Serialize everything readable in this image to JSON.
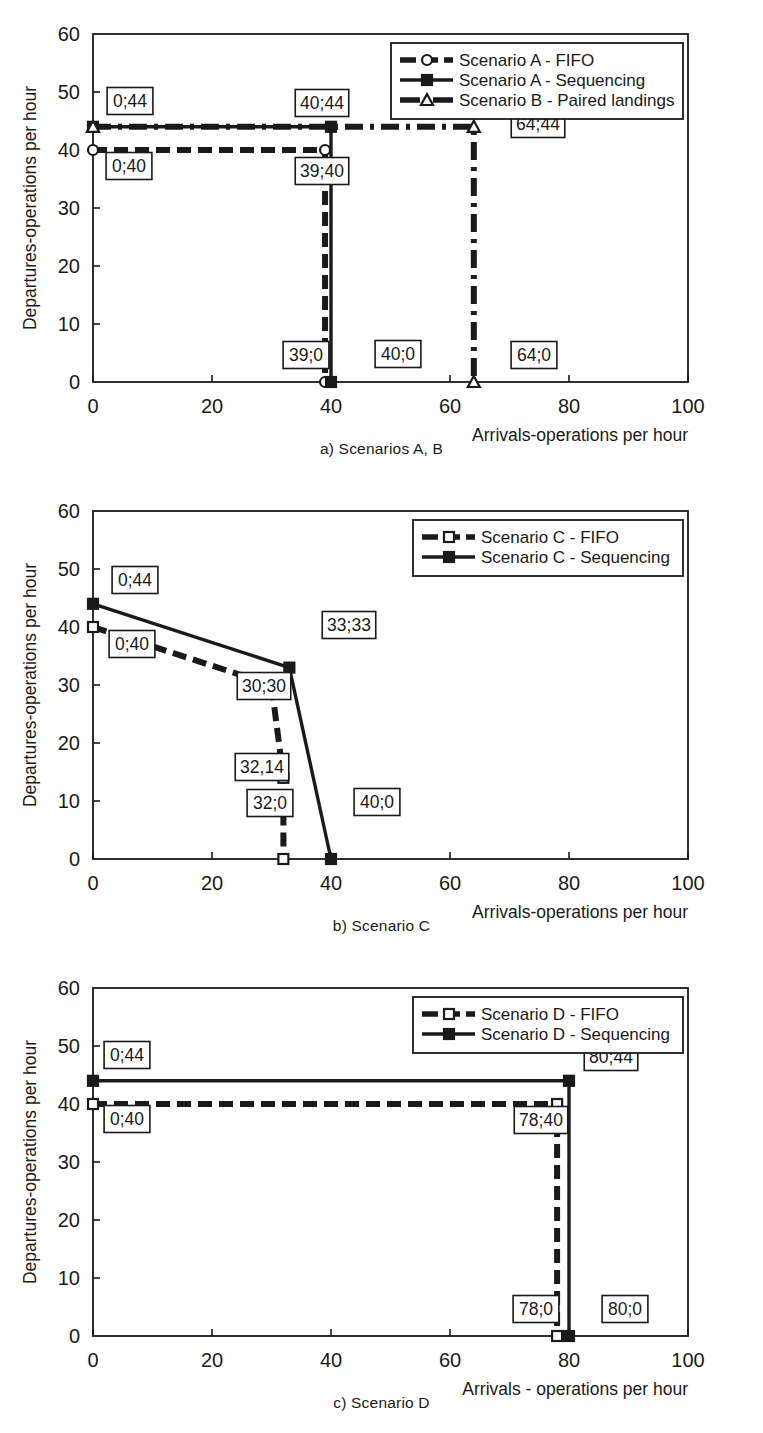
{
  "figure": {
    "panels": [
      {
        "id": "panel-a",
        "caption": "a) Scenarios A, B",
        "xlabel": "Arrivals-operations per hour",
        "ylabel": "Departures-operations per hour",
        "xticks": [
          "0",
          "20",
          "40",
          "60",
          "80",
          "100"
        ],
        "yticks": [
          "0",
          "10",
          "20",
          "30",
          "40",
          "50",
          "60"
        ],
        "legend": [
          {
            "label": "Scenario A - FIFO",
            "marker": "circle-open",
            "line": "dashed"
          },
          {
            "label": "Scenario A - Sequencing",
            "marker": "square-filled",
            "line": "solid"
          },
          {
            "label": "Scenario B - Paired landings",
            "marker": "triangle-open",
            "line": "dash-dot"
          }
        ],
        "annotations": [
          "0;44",
          "0;40",
          "40;44",
          "39;40",
          "39;0",
          "40;0",
          "64;44",
          "64;0"
        ]
      },
      {
        "id": "panel-b",
        "caption": "b)  Scenario C",
        "xlabel": "Arrivals-operations per hour",
        "ylabel": "Departures-operations per hour",
        "xticks": [
          "0",
          "20",
          "40",
          "60",
          "80",
          "100"
        ],
        "yticks": [
          "0",
          "10",
          "20",
          "30",
          "40",
          "50",
          "60"
        ],
        "legend": [
          {
            "label": "Scenario C - FIFO",
            "marker": "square-open",
            "line": "dashed"
          },
          {
            "label": "Scenario C - Sequencing",
            "marker": "square-filled",
            "line": "solid"
          }
        ],
        "annotations": [
          "0;44",
          "0;40",
          "33;33",
          "30;30",
          "32,14",
          "32;0",
          "40;0"
        ]
      },
      {
        "id": "panel-c",
        "caption": "c) Scenario D",
        "xlabel": "Arrivals - operations per hour",
        "ylabel": "Departures-operations per hour",
        "xticks": [
          "0",
          "20",
          "40",
          "60",
          "80",
          "100"
        ],
        "yticks": [
          "0",
          "10",
          "20",
          "30",
          "40",
          "50",
          "60"
        ],
        "legend": [
          {
            "label": "Scenario D - FIFO",
            "marker": "square-open",
            "line": "dashed"
          },
          {
            "label": "Scenario D - Sequencing",
            "marker": "square-filled",
            "line": "solid"
          }
        ],
        "annotations": [
          "0;44",
          "0;40",
          "80;44",
          "78;40",
          "78;0",
          "80;0"
        ]
      }
    ]
  },
  "chart_data": [
    {
      "type": "line",
      "title": "a) Scenarios A, B",
      "xlabel": "Arrivals-operations per hour",
      "ylabel": "Departures-operations per hour",
      "xlim": [
        0,
        100
      ],
      "ylim": [
        0,
        60
      ],
      "xticks": [
        0,
        20,
        40,
        60,
        80,
        100
      ],
      "yticks": [
        0,
        10,
        20,
        30,
        40,
        50,
        60
      ],
      "grid": false,
      "legend_position": "top-right",
      "series": [
        {
          "name": "Scenario A - FIFO",
          "style": "dashed",
          "marker": "circle-open",
          "points": [
            [
              0,
              40
            ],
            [
              39,
              40
            ],
            [
              39,
              0
            ]
          ],
          "labels": [
            "0;40",
            "39;40",
            "39;0"
          ]
        },
        {
          "name": "Scenario A - Sequencing",
          "style": "solid",
          "marker": "square-filled",
          "points": [
            [
              0,
              44
            ],
            [
              40,
              44
            ],
            [
              40,
              0
            ]
          ],
          "labels": [
            "0;44",
            "40;44",
            "40;0"
          ]
        },
        {
          "name": "Scenario B - Paired landings",
          "style": "dash-dot",
          "marker": "triangle-open",
          "points": [
            [
              0,
              44
            ],
            [
              64,
              44
            ],
            [
              64,
              0
            ]
          ],
          "labels": [
            "0;44",
            "64;44",
            "64;0"
          ]
        }
      ]
    },
    {
      "type": "line",
      "title": "b)  Scenario C",
      "xlabel": "Arrivals-operations per hour",
      "ylabel": "Departures-operations per hour",
      "xlim": [
        0,
        100
      ],
      "ylim": [
        0,
        60
      ],
      "xticks": [
        0,
        20,
        40,
        60,
        80,
        100
      ],
      "yticks": [
        0,
        10,
        20,
        30,
        40,
        50,
        60
      ],
      "grid": false,
      "legend_position": "top-right",
      "series": [
        {
          "name": "Scenario C - FIFO",
          "style": "dashed",
          "marker": "square-open",
          "points": [
            [
              0,
              40
            ],
            [
              30,
              30
            ],
            [
              32,
              14
            ],
            [
              32,
              0
            ]
          ],
          "labels": [
            "0;40",
            "30;30",
            "32,14",
            "32;0"
          ]
        },
        {
          "name": "Scenario C - Sequencing",
          "style": "solid",
          "marker": "square-filled",
          "points": [
            [
              0,
              44
            ],
            [
              33,
              33
            ],
            [
              40,
              0
            ]
          ],
          "labels": [
            "0;44",
            "33;33",
            "40;0"
          ]
        }
      ]
    },
    {
      "type": "line",
      "title": "c) Scenario D",
      "xlabel": "Arrivals - operations per hour",
      "ylabel": "Departures-operations per hour",
      "xlim": [
        0,
        100
      ],
      "ylim": [
        0,
        60
      ],
      "xticks": [
        0,
        20,
        40,
        60,
        80,
        100
      ],
      "yticks": [
        0,
        10,
        20,
        30,
        40,
        50,
        60
      ],
      "grid": false,
      "legend_position": "top-right",
      "series": [
        {
          "name": "Scenario D - FIFO",
          "style": "dashed",
          "marker": "square-open",
          "points": [
            [
              0,
              40
            ],
            [
              78,
              40
            ],
            [
              78,
              0
            ]
          ],
          "labels": [
            "0;40",
            "78;40",
            "78;0"
          ]
        },
        {
          "name": "Scenario D - Sequencing",
          "style": "solid",
          "marker": "square-filled",
          "points": [
            [
              0,
              44
            ],
            [
              80,
              44
            ],
            [
              80,
              0
            ]
          ],
          "labels": [
            "0;44",
            "80;44",
            "80;0"
          ]
        }
      ]
    }
  ]
}
